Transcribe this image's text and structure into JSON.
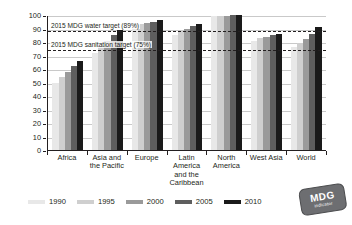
{
  "chart_data": {
    "type": "bar",
    "title": "",
    "xlabel": "",
    "ylabel": "per cent of total population",
    "ylim": [
      0,
      100
    ],
    "ytick_values": [
      0,
      10,
      20,
      30,
      40,
      50,
      60,
      70,
      80,
      90,
      100
    ],
    "ytick_labels": [
      "0",
      "10",
      "20",
      "30",
      "40",
      "50",
      "60",
      "70",
      "80",
      "90",
      "100"
    ],
    "grid": true,
    "legend_position": "bottom",
    "categories": [
      "Africa",
      "Asia and the Pacific",
      "Europe",
      "Latin America and the Caribbean",
      "North America",
      "West Asia",
      "World"
    ],
    "series": [
      {
        "name": "1990",
        "color": "#e8e8e8",
        "values": [
          50,
          72,
          92,
          85,
          99,
          81,
          76
        ]
      },
      {
        "name": "1995",
        "color": "#cfcfcf",
        "values": [
          54,
          77,
          93,
          88,
          99,
          83,
          79
        ]
      },
      {
        "name": "2000",
        "color": "#9a9a9a",
        "values": [
          58,
          81,
          94,
          90,
          99,
          84,
          82
        ]
      },
      {
        "name": "2005",
        "color": "#5e5e5e",
        "values": [
          62,
          85,
          95,
          92,
          100,
          85,
          86
        ]
      },
      {
        "name": "2010",
        "color": "#1a1a1a",
        "values": [
          66,
          89,
          96,
          93,
          100,
          86,
          91
        ]
      }
    ],
    "annotations": [
      {
        "name": "water-target",
        "label": "2015 MDG water target (89%)",
        "value": 89
      },
      {
        "name": "sanitation-target",
        "label": "2015 MDG sanitation target (75%)",
        "value": 75
      }
    ]
  },
  "logo": {
    "main": "MDG",
    "sub": "indicator"
  }
}
